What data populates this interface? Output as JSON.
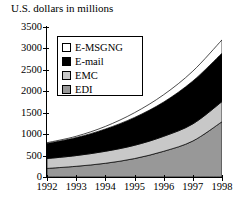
{
  "chart_data": {
    "type": "area",
    "title": "U.S. dollars in millions",
    "xlabel": "",
    "ylabel": "",
    "stacked": true,
    "grid": false,
    "legend_position": "upper-left-inside",
    "categories": [
      "1992",
      "1993",
      "1994",
      "1995",
      "1996",
      "1997",
      "1998"
    ],
    "x": [
      1992,
      1993,
      1994,
      1995,
      1996,
      1997,
      1998
    ],
    "xlim": [
      1992,
      1998
    ],
    "ylim": [
      0,
      3500
    ],
    "ytick_values": [
      0,
      500,
      1000,
      1500,
      2000,
      2500,
      3000,
      3500
    ],
    "ytick_labels": [
      "0",
      "500",
      "1000",
      "1500",
      "2000",
      "2500",
      "3000",
      "3500"
    ],
    "series": [
      {
        "name": "EDI",
        "color": "#989898",
        "values": [
          200,
          250,
          320,
          430,
          600,
          840,
          1290
        ]
      },
      {
        "name": "EMC",
        "color": "#c8c8c8",
        "values": [
          230,
          250,
          280,
          310,
          350,
          400,
          470
        ]
      },
      {
        "name": "E-mail",
        "color": "#000000",
        "values": [
          350,
          420,
          520,
          650,
          800,
          1000,
          1130
        ]
      },
      {
        "name": "E-MSGNG",
        "color": "#ffffff",
        "values": [
          20,
          30,
          60,
          110,
          170,
          230,
          310
        ]
      }
    ],
    "cumulative_totals": [
      800,
      950,
      1180,
      1500,
      1920,
      2470,
      3200
    ]
  },
  "legend": {
    "items": [
      {
        "label": "E-MSGNG",
        "color": "#ffffff"
      },
      {
        "label": "E-mail",
        "color": "#000000"
      },
      {
        "label": "EMC",
        "color": "#c8c8c8"
      },
      {
        "label": "EDI",
        "color": "#989898"
      }
    ]
  }
}
